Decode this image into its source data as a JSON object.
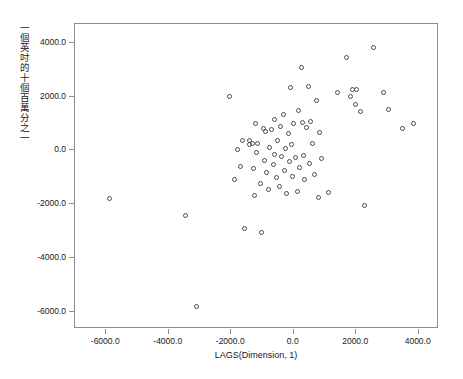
{
  "chart_data": {
    "type": "scatter",
    "title": "",
    "xlabel": "LAGS(Dimension, 1)",
    "ylabel": "一個英吋的十個百萬分之一",
    "xlim": [
      -7000,
      4650
    ],
    "ylim": [
      -6650,
      4700
    ],
    "grid": false,
    "legend": null,
    "marker": "open-circle",
    "marker_color": "#4a4a55",
    "xticks": [
      -6000,
      -4000,
      -2000,
      0,
      2000,
      4000
    ],
    "xticklabels": [
      "-6000.0",
      "-4000.0",
      "-2000.0",
      "0.0",
      "2000.0",
      "4000.0"
    ],
    "yticks": [
      4000,
      2000,
      0,
      -2000,
      -4000,
      -6000
    ],
    "yticklabels": [
      "4000.0",
      "2000.0",
      "0.0",
      "-2000.0",
      "-4000.0",
      "-6000.0"
    ],
    "n_points": 73,
    "points": [
      [
        -5900,
        -1800
      ],
      [
        -3470,
        -2420
      ],
      [
        -3100,
        -5800
      ],
      [
        -2060,
        2020
      ],
      [
        -1900,
        -1080
      ],
      [
        -1800,
        40
      ],
      [
        -1700,
        -620
      ],
      [
        -1640,
        380
      ],
      [
        -1560,
        -2900
      ],
      [
        -1420,
        230
      ],
      [
        -1400,
        350
      ],
      [
        -1330,
        250
      ],
      [
        -1300,
        -680
      ],
      [
        -1270,
        -1680
      ],
      [
        -1230,
        1000
      ],
      [
        -1180,
        -100
      ],
      [
        -1150,
        260
      ],
      [
        -1060,
        -1250
      ],
      [
        -1020,
        -3060
      ],
      [
        -980,
        800
      ],
      [
        -930,
        -380
      ],
      [
        -900,
        690
      ],
      [
        -880,
        -820
      ],
      [
        -820,
        -1450
      ],
      [
        -780,
        120
      ],
      [
        -700,
        760
      ],
      [
        -660,
        -540
      ],
      [
        -620,
        1150
      ],
      [
        -600,
        -160
      ],
      [
        -560,
        -1020
      ],
      [
        -520,
        360
      ],
      [
        -470,
        -1340
      ],
      [
        -430,
        900
      ],
      [
        -380,
        -240
      ],
      [
        -340,
        1350
      ],
      [
        -300,
        -760
      ],
      [
        -270,
        60
      ],
      [
        -230,
        -1600
      ],
      [
        -180,
        620
      ],
      [
        -140,
        -430
      ],
      [
        -100,
        2340
      ],
      [
        -80,
        200
      ],
      [
        -40,
        -980
      ],
      [
        0,
        980
      ],
      [
        60,
        -250
      ],
      [
        110,
        -1520
      ],
      [
        160,
        1480
      ],
      [
        200,
        -640
      ],
      [
        240,
        3080
      ],
      [
        280,
        1020
      ],
      [
        310,
        -180
      ],
      [
        360,
        -1100
      ],
      [
        420,
        860
      ],
      [
        460,
        2390
      ],
      [
        500,
        -480
      ],
      [
        540,
        1060
      ],
      [
        600,
        240
      ],
      [
        660,
        -900
      ],
      [
        720,
        1860
      ],
      [
        780,
        -1760
      ],
      [
        840,
        660
      ],
      [
        900,
        -300
      ],
      [
        1120,
        -1560
      ],
      [
        1390,
        2150
      ],
      [
        1680,
        3460
      ],
      [
        1820,
        2010
      ],
      [
        1880,
        2260
      ],
      [
        1980,
        1720
      ],
      [
        2020,
        2280
      ],
      [
        2150,
        1440
      ],
      [
        2280,
        -2060
      ],
      [
        2560,
        3840
      ],
      [
        2880,
        2150
      ],
      [
        3040,
        1500
      ],
      [
        3480,
        800
      ],
      [
        3820,
        1000
      ]
    ]
  },
  "axis": {
    "x_label": "LAGS(Dimension, 1)",
    "y_label": "一個英吋的十個百萬分之一"
  }
}
